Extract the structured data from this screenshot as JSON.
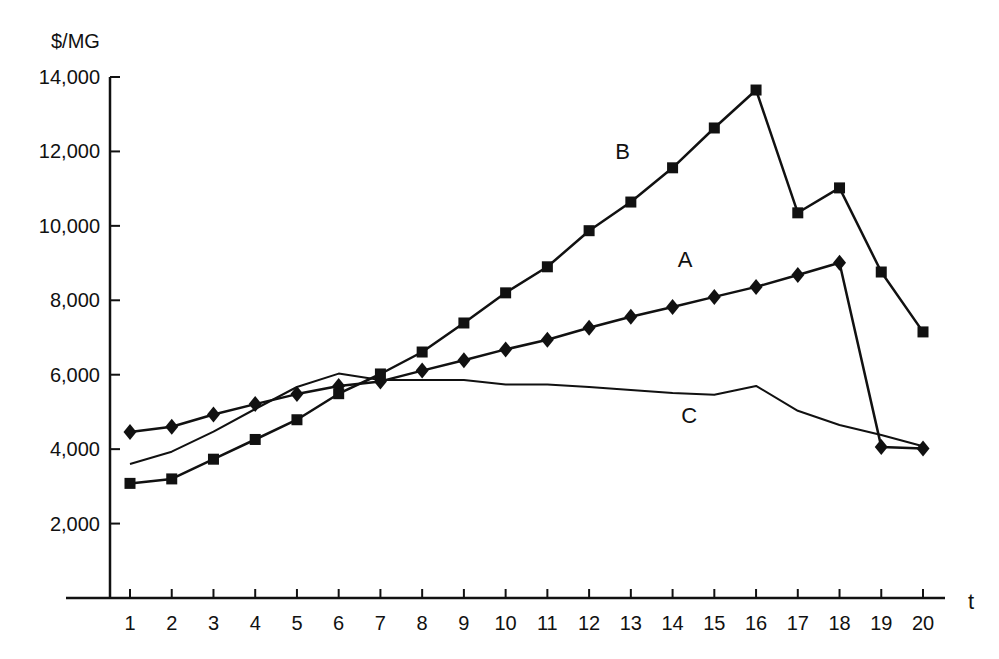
{
  "chart_data": {
    "type": "line",
    "title": "",
    "xlabel": "t",
    "ylabel": "$/MG",
    "xlim": [
      1,
      20
    ],
    "ylim": [
      0,
      14000
    ],
    "grid": false,
    "legend": "inline labels",
    "x": [
      1,
      2,
      3,
      4,
      5,
      6,
      7,
      8,
      9,
      10,
      11,
      12,
      13,
      14,
      15,
      16,
      17,
      18,
      19,
      20
    ],
    "y_ticks": [
      2000,
      4000,
      6000,
      8000,
      10000,
      12000,
      14000
    ],
    "y_tick_labels": [
      "2,000",
      "4,000",
      "6,000",
      "8,000",
      "10,000",
      "12,000",
      "14,000"
    ],
    "series": [
      {
        "name": "A",
        "marker": "diamond",
        "values": [
          4460,
          4600,
          4930,
          5210,
          5480,
          5700,
          5820,
          6110,
          6390,
          6680,
          6940,
          7260,
          7560,
          7820,
          8090,
          8360,
          8680,
          9010,
          4060,
          4020
        ]
      },
      {
        "name": "B",
        "marker": "square",
        "values": [
          3080,
          3200,
          3730,
          4260,
          4790,
          5490,
          6020,
          6610,
          7390,
          8200,
          8900,
          9870,
          10640,
          11560,
          12630,
          13650,
          10350,
          11020,
          8760,
          7150
        ]
      },
      {
        "name": "C",
        "marker": "none",
        "values": [
          3600,
          3930,
          4470,
          5080,
          5670,
          6030,
          5860,
          5860,
          5860,
          5740,
          5740,
          5670,
          5590,
          5510,
          5460,
          5700,
          5030,
          4650,
          4380,
          4080
        ]
      }
    ],
    "annotations": [
      {
        "text": "A",
        "x": 14.3,
        "y": 8900
      },
      {
        "text": "B",
        "x": 12.8,
        "y": 11800
      },
      {
        "text": "C",
        "x": 14.4,
        "y": 4700
      }
    ]
  },
  "axes": {
    "y_title": "$/MG",
    "x_title": "t"
  },
  "colors": {
    "line": "#111111",
    "background": "#ffffff"
  }
}
